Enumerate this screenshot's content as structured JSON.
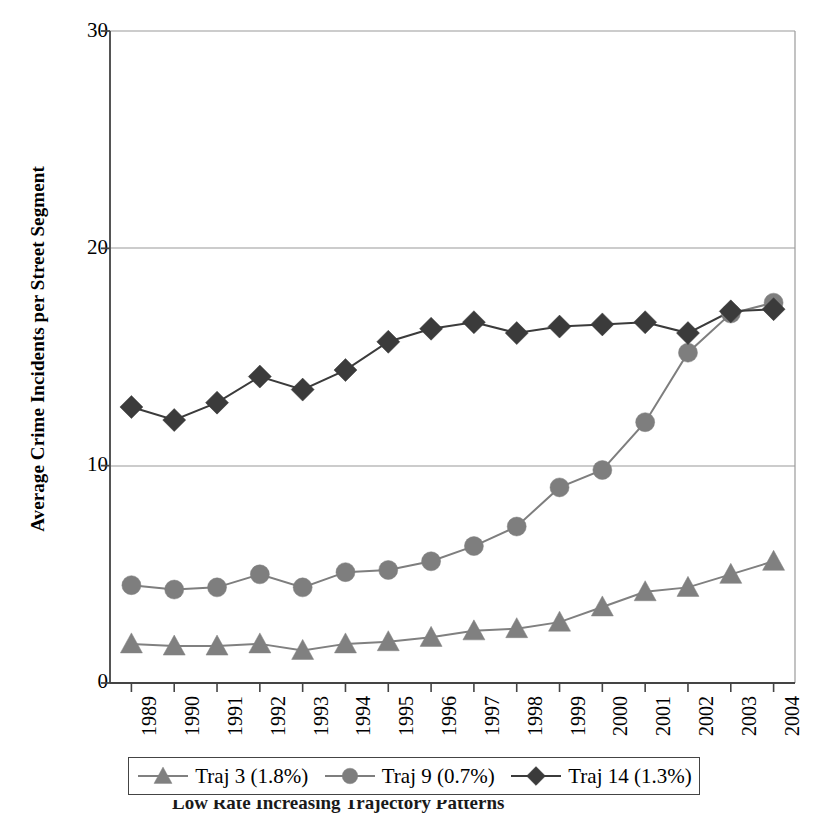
{
  "chart_data": {
    "type": "line",
    "title": "",
    "xlabel": "",
    "ylabel": "Average Crime Incidents per Street Segment",
    "categories": [
      "1989",
      "1990",
      "1991",
      "1992",
      "1993",
      "1994",
      "1995",
      "1996",
      "1997",
      "1998",
      "1999",
      "2000",
      "2001",
      "2002",
      "2003",
      "2004"
    ],
    "ylim": [
      0,
      30
    ],
    "yticks": [
      0,
      10,
      20,
      30
    ],
    "ytick_labels": [
      "0",
      "10",
      "20",
      "30"
    ],
    "grid": "horizontal",
    "legend_position": "bottom",
    "series": [
      {
        "name": "Traj 3 (1.8%)",
        "marker": "triangle",
        "color": "#808080",
        "values": [
          1.8,
          1.7,
          1.7,
          1.8,
          1.5,
          1.8,
          1.9,
          2.1,
          2.4,
          2.5,
          2.8,
          3.5,
          4.2,
          4.4,
          5.0,
          5.6
        ]
      },
      {
        "name": "Traj 9 (0.7%)",
        "marker": "circle",
        "color": "#7e7e7e",
        "values": [
          4.5,
          4.3,
          4.4,
          5.0,
          4.4,
          5.1,
          5.2,
          5.6,
          6.3,
          7.2,
          9.0,
          9.8,
          12.0,
          15.2,
          17.0,
          17.5
        ]
      },
      {
        "name": "Traj 14 (1.3%)",
        "marker": "diamond",
        "color": "#3b3b3b",
        "values": [
          12.7,
          12.1,
          12.9,
          14.1,
          13.5,
          14.4,
          15.7,
          16.3,
          16.6,
          16.1,
          16.4,
          16.5,
          16.6,
          16.1,
          17.1,
          17.2
        ]
      }
    ]
  },
  "axis": {
    "y_title": "Average Crime Incidents per Street Segment",
    "y_labels": [
      "30",
      "20",
      "10",
      "0"
    ],
    "x_labels": [
      "1989",
      "1990",
      "1991",
      "1992",
      "1993",
      "1994",
      "1995",
      "1996",
      "1997",
      "1998",
      "1999",
      "2000",
      "2001",
      "2002",
      "2003",
      "2004"
    ]
  },
  "legend": {
    "entries": [
      {
        "label": "Traj 3 (1.8%)",
        "marker": "triangle-marker",
        "color": "#808080"
      },
      {
        "label": "Traj 9 (0.7%)",
        "marker": "circle-marker",
        "color": "#7e7e7e"
      },
      {
        "label": "Traj 14 (1.3%)",
        "marker": "diamond-marker",
        "color": "#3b3b3b"
      }
    ]
  },
  "caption": {
    "text": "Low Rate Increasing Trajectory Patterns"
  }
}
